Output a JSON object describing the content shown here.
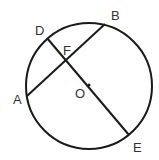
{
  "diagram": {
    "type": "circle-geometry",
    "stroke_color": "#1a1a1a",
    "label_color": "#333333",
    "circle": {
      "center": [
        89,
        86
      ],
      "radius": 63,
      "center_label": "O"
    },
    "points": {
      "A": {
        "label": "A",
        "pos": [
          27,
          96
        ]
      },
      "B": {
        "label": "B",
        "pos": [
          105,
          24
        ]
      },
      "D": {
        "label": "D",
        "pos": [
          47,
          38
        ]
      },
      "E": {
        "label": "E",
        "pos": [
          129,
          135
        ]
      },
      "F": {
        "label": "F",
        "pos": [
          67,
          60
        ]
      },
      "O": {
        "label": "O",
        "pos": [
          89,
          85
        ]
      }
    },
    "segments": [
      {
        "name": "chord-AB",
        "from": "A",
        "to": "B"
      },
      {
        "name": "chord-DE",
        "from": "D",
        "to": "E",
        "passes_through": "O"
      }
    ],
    "labels": {
      "A": "A",
      "B": "B",
      "D": "D",
      "E": "E",
      "F": "F",
      "O": "O"
    }
  }
}
